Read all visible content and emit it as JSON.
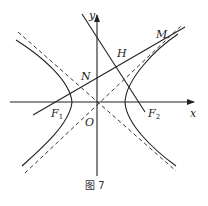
{
  "figure": {
    "caption": "图 7",
    "labels": {
      "x_axis": "x",
      "y_axis": "y",
      "origin": "O",
      "F1": "F",
      "F1_sub": "1",
      "F2": "F",
      "F2_sub": "2",
      "M": "M",
      "N": "N",
      "H": "H"
    },
    "colors": {
      "stroke": "#222222",
      "background": "#ffffff"
    }
  }
}
